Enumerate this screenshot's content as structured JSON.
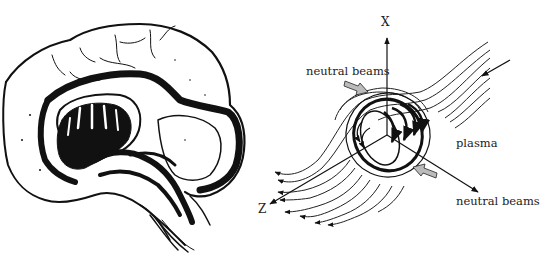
{
  "figure": {
    "left_panel": {
      "subject": "brain sagittal section sketch"
    },
    "right_panel": {
      "subject": "plasma with neutral beams and field lines",
      "axis_x_label": "X",
      "axis_z_label": "Z",
      "label_neutral_beams_top": "neutral beams",
      "label_neutral_beams_bottom": "neutral beams",
      "label_plasma": "plasma"
    },
    "colors": {
      "ink": "#111111",
      "background": "#ffffff",
      "beam_arrow_fill": "#9a9a9a"
    }
  }
}
